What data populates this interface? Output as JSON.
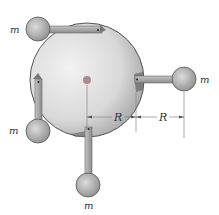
{
  "diagram": {
    "type": "disk-with-pendulum-masses",
    "mass_label": "m",
    "dimension_label": "R",
    "masses": [
      {
        "position": "top",
        "label": "m"
      },
      {
        "position": "right",
        "label": "m"
      },
      {
        "position": "left",
        "label": "m"
      },
      {
        "position": "bottom",
        "label": "m"
      }
    ],
    "dimensions": [
      {
        "label": "R",
        "from": "disk-center",
        "to": "disk-edge"
      },
      {
        "label": "R",
        "from": "disk-edge",
        "to": "right-mass-center"
      }
    ],
    "colors": {
      "disk_light": "#eeeeee",
      "disk_dark": "#9a9a9a",
      "disk_edge": "#555555",
      "rod": "#a8a8a8",
      "ball_light": "#d8d8d8",
      "ball_dark": "#8a8a8a",
      "center_dot": "#b08a8a",
      "line": "#888888"
    }
  }
}
